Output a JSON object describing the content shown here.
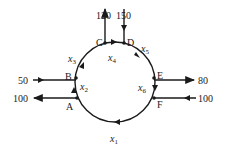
{
  "diagram": {
    "type": "traffic-flow-network",
    "nodes": [
      {
        "id": "A",
        "label": "A"
      },
      {
        "id": "B",
        "label": "B"
      },
      {
        "id": "C",
        "label": "C"
      },
      {
        "id": "D",
        "label": "D"
      },
      {
        "id": "E",
        "label": "E"
      },
      {
        "id": "F",
        "label": "F"
      }
    ],
    "internal_flows": [
      {
        "var": "x",
        "sub": "1",
        "from": "F",
        "to": "A"
      },
      {
        "var": "x",
        "sub": "2",
        "from": "A",
        "to": "B"
      },
      {
        "var": "x",
        "sub": "3",
        "from": "B",
        "to": "C"
      },
      {
        "var": "x",
        "sub": "4",
        "from": "C",
        "to": "D"
      },
      {
        "var": "x",
        "sub": "5",
        "from": "D",
        "to": "E"
      },
      {
        "var": "x",
        "sub": "6",
        "from": "E",
        "to": "F"
      }
    ],
    "external_flows": [
      {
        "node": "A",
        "value": "100",
        "direction": "out"
      },
      {
        "node": "B",
        "value": "50",
        "direction": "in"
      },
      {
        "node": "C",
        "value": "120",
        "direction": "out"
      },
      {
        "node": "D",
        "value": "150",
        "direction": "in"
      },
      {
        "node": "E",
        "value": "80",
        "direction": "out"
      },
      {
        "node": "F",
        "value": "100",
        "direction": "in"
      }
    ],
    "colors": {
      "line": "#1a1a1a",
      "background": "#ffffff"
    }
  }
}
